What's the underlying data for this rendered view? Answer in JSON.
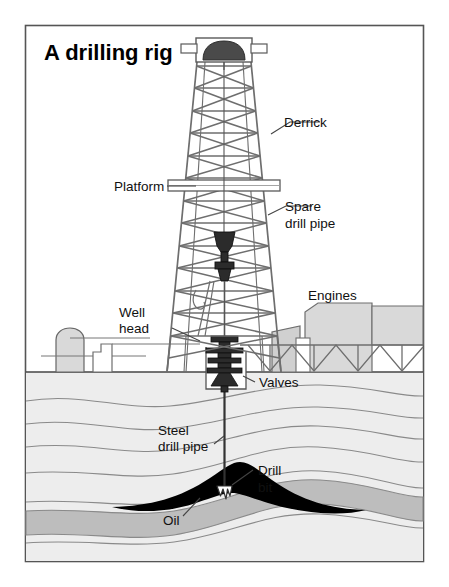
{
  "figure": {
    "title": "A drilling rig",
    "kind": "cutaway-diagram",
    "frame": {
      "border_color": "#555555",
      "background": "#ffffff"
    }
  },
  "labels": {
    "derrick": "Derrick",
    "platform": "Platform",
    "spare_drill_pipe_line1": "Spare",
    "spare_drill_pipe_line2": "drill pipe",
    "engines": "Engines",
    "well_head_line1": "Well",
    "well_head_line2": "head",
    "valves": "Valves",
    "steel_drill_pipe_line1": "Steel",
    "steel_drill_pipe_line2": "drill pipe",
    "drill_bit_line1": "Drill",
    "drill_bit_line2": "bit",
    "oil": "Oil"
  },
  "colors": {
    "outline": "#555555",
    "structure_gray": "#6e6e6e",
    "fill_light": "#d9d9d9",
    "fill_mid": "#c2c2c2",
    "ground_light": "#ededed",
    "strata_line": "#8a8a8a",
    "oil_black": "#000000",
    "oil_underlayer": "#bdbdbd",
    "text": "#111111",
    "white": "#ffffff"
  },
  "parts": {
    "crown_block": "crown-block",
    "derrick_tower": "derrick-lattice-tower",
    "platform_bar": "platform-bar",
    "traveling_block": "traveling-block",
    "swivel_hook": "swivel-hook",
    "wellhead_stack": "wellhead-valve-stack",
    "engine_house": "engine-house",
    "storage_tank": "storage-tank",
    "truss_walkway": "truss-walkway",
    "drill_string": "drill-string",
    "drill_bit": "drill-bit",
    "oil_reservoir": "oil-reservoir-anticline",
    "strata": "geological-strata"
  }
}
